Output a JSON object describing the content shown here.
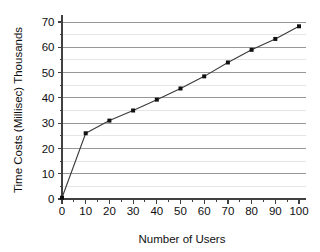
{
  "chart_data": {
    "type": "line",
    "title": "",
    "xlabel": "Number of Users",
    "ylabel": "Time Costs (Millisec) Thousands",
    "x": [
      0,
      10,
      20,
      30,
      40,
      50,
      60,
      70,
      80,
      90,
      100
    ],
    "values": [
      0.5,
      26.0,
      31.0,
      35.0,
      39.3,
      43.7,
      48.5,
      54.0,
      59.0,
      63.3,
      68.3
    ],
    "series": [
      {
        "name": "Time Costs",
        "values": [
          0.5,
          26.0,
          31.0,
          35.0,
          39.3,
          43.7,
          48.5,
          54.0,
          59.0,
          63.3,
          68.3
        ]
      }
    ],
    "xlim": [
      0,
      100
    ],
    "ylim": [
      0,
      70
    ],
    "x_ticks": [
      0,
      10,
      20,
      30,
      40,
      50,
      60,
      70,
      80,
      90,
      100
    ],
    "x_tick_labels": [
      "0",
      "10",
      "20",
      "30",
      "40",
      "50",
      "60",
      "70",
      "80",
      "90",
      "100"
    ],
    "x_minor_tick_step": 5,
    "y_ticks": [
      0,
      10,
      20,
      30,
      40,
      50,
      60,
      70
    ],
    "y_tick_labels": [
      "0",
      "10",
      "20",
      "30",
      "40",
      "50",
      "60",
      "70"
    ],
    "y_minor_tick_step": 5,
    "grid": {
      "horizontal_major": true,
      "horizontal_minor": true,
      "vertical": false,
      "major_color": "#8c8c8c",
      "minor_color": "#dedede"
    },
    "legend": {
      "visible": false,
      "position": "none",
      "entries": []
    },
    "marker": {
      "shape": "square",
      "size": 4,
      "color": "#111111"
    },
    "line_color": "#3a3a3a",
    "background_color": "#ffffff"
  }
}
